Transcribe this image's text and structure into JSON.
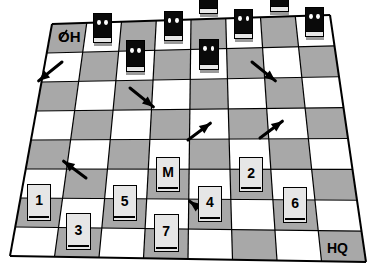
{
  "scene": {
    "title": "tactical-grid-board",
    "width": 374,
    "height": 279,
    "background": "#ffffff"
  },
  "board": {
    "columns": 8,
    "rows": 8,
    "pattern": "checkerboard",
    "colors": {
      "light_square": "#ffffff",
      "dark_square": "#a8a8a8",
      "grid_line": "#000000",
      "card_face": "#e6e6e6",
      "enemy_body": "#0a0a0a",
      "enemy_eye": "#ffffff",
      "arrow": "#000000"
    },
    "perspective": {
      "top_left": [
        52,
        24
      ],
      "top_right": [
        330,
        15
      ],
      "bottom_right": [
        366,
        262
      ],
      "bottom_left": [
        10,
        256
      ]
    }
  },
  "labels": {
    "origin": "OH",
    "origin_has_slash": true,
    "destination": "HQ"
  },
  "enemies": [
    {
      "id": "enemy-1",
      "col": 1,
      "row": 0,
      "eyes": 2
    },
    {
      "id": "enemy-2",
      "col": 2,
      "row": 1,
      "eyes": 2
    },
    {
      "id": "enemy-3",
      "col": 3,
      "row": 0,
      "eyes": 2
    },
    {
      "id": "enemy-4",
      "col": 4,
      "row": -1,
      "eyes": 2
    },
    {
      "id": "enemy-5",
      "col": 4,
      "row": 1,
      "eyes": 2
    },
    {
      "id": "enemy-6",
      "col": 5,
      "row": 0,
      "eyes": 2
    },
    {
      "id": "enemy-7",
      "col": 6,
      "row": -1,
      "eyes": 2
    },
    {
      "id": "enemy-8",
      "col": 7,
      "row": 0,
      "eyes": 2
    }
  ],
  "cards": [
    {
      "id": "card-1",
      "label": "1",
      "col": 0,
      "row": 6
    },
    {
      "id": "card-3",
      "label": "3",
      "col": 1,
      "row": 7
    },
    {
      "id": "card-5",
      "label": "5",
      "col": 2,
      "row": 6
    },
    {
      "id": "card-7",
      "label": "7",
      "col": 3,
      "row": 7
    },
    {
      "id": "card-M",
      "label": "M",
      "col": 3,
      "row": 5
    },
    {
      "id": "card-4",
      "label": "4",
      "col": 4,
      "row": 6
    },
    {
      "id": "card-2",
      "label": "2",
      "col": 5,
      "row": 5
    },
    {
      "id": "card-6",
      "label": "6",
      "col": 6,
      "row": 6
    }
  ],
  "arrows": [
    {
      "id": "arrow-1",
      "direction": "down-left",
      "x": 62,
      "y": 62,
      "length": 30
    },
    {
      "id": "arrow-2",
      "direction": "down-right",
      "x": 130,
      "y": 88,
      "length": 30
    },
    {
      "id": "arrow-3",
      "direction": "down-right",
      "x": 252,
      "y": 62,
      "length": 30
    },
    {
      "id": "arrow-4",
      "direction": "up-right",
      "x": 188,
      "y": 140,
      "length": 28
    },
    {
      "id": "arrow-5",
      "direction": "up-right",
      "x": 260,
      "y": 138,
      "length": 28
    },
    {
      "id": "arrow-6",
      "direction": "up-left",
      "x": 86,
      "y": 178,
      "length": 28
    },
    {
      "id": "arrow-7",
      "direction": "up-left",
      "x": 212,
      "y": 218,
      "length": 28
    }
  ]
}
